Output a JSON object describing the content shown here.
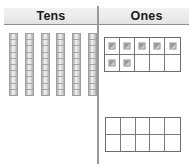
{
  "diagram": {
    "title_bar": {
      "columns": [
        {
          "label": "Tens",
          "name": "tens"
        },
        {
          "label": "Ones",
          "name": "ones"
        }
      ]
    },
    "tens_column": {
      "label": "Tens",
      "rod_count": 6,
      "segments_per_rod": 10,
      "value": 60
    },
    "ones_column": {
      "label": "Ones",
      "frames": [
        {
          "name": "top-ten-frame",
          "rows": 2,
          "columns": 5,
          "filled_cells": [
            true,
            true,
            true,
            true,
            true,
            true,
            true,
            false,
            false,
            false
          ],
          "filled_count": 7
        },
        {
          "name": "bottom-ten-frame",
          "rows": 2,
          "columns": 5,
          "filled_cells": [
            false,
            false,
            false,
            false,
            false,
            false,
            false,
            false,
            false,
            false
          ],
          "filled_count": 0
        }
      ],
      "value": 7
    },
    "colors": {
      "band_fill": "#ebebeb",
      "band_rule": "#8e8e8e",
      "divider": "#9a9a9a",
      "frame_border": "#6d6d6d",
      "frame_grid": "#7a7a7a",
      "rod_border": "#9d9d9d",
      "cube_fill": "#9f9f9f",
      "text": "#1b1b1b",
      "background": "#ffffff"
    }
  }
}
